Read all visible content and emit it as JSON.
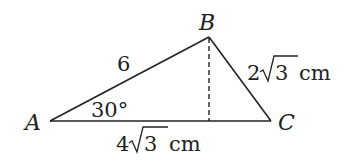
{
  "diagram": {
    "type": "triangle",
    "vertices": {
      "A": {
        "label": "A"
      },
      "B": {
        "label": "B"
      },
      "C": {
        "label": "C"
      }
    },
    "sides": {
      "AB": {
        "label": "6"
      },
      "BC": {
        "label_coef": "2",
        "label_rad": "3",
        "label_unit": "cm"
      },
      "AC": {
        "label_coef": "4",
        "label_rad": "3",
        "label_unit": "cm"
      }
    },
    "angle_A": {
      "label": "30°"
    },
    "altitude": {
      "from": "B",
      "to": "AC",
      "style": "dashed"
    },
    "colors": {
      "stroke": "#222222",
      "background": "#ffffff"
    }
  }
}
